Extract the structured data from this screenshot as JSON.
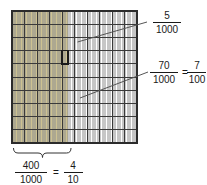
{
  "figure": {
    "type": "fraction-grid-diagram",
    "grid": {
      "major_columns": 10,
      "major_rows": 10,
      "sub_columns_per_major": 10,
      "total_parts": 1000,
      "shaded_parts": 405,
      "shaded_color": "#cdc292",
      "unshaded_color": "#ffffff",
      "line_color": "#3a3a3a",
      "thin_line_color": "#8d8d8d",
      "border_color": "#2b2b2b"
    },
    "highlight_box": {
      "label": "five-thousandths-box",
      "parts": 5,
      "stroke_color": "#1a1a1a"
    }
  },
  "labels": {
    "top_fraction": {
      "name": "five-thousandths",
      "numerator": "5",
      "denominator": "1000"
    },
    "middle_fraction": {
      "name": "seventy-thousandths",
      "numerator": "70",
      "denominator": "1000",
      "equals": "=",
      "equiv_numerator": "7",
      "equiv_denominator": "100"
    },
    "bottom_fraction": {
      "name": "four-hundred-thousandths",
      "numerator": "400",
      "denominator": "1000",
      "equals": "=",
      "equiv_numerator": "4",
      "equiv_denominator": "10"
    }
  },
  "annotations": {
    "leader_line_top": "leader-line-to-five-thousandths",
    "leader_line_middle": "leader-line-to-seventy-thousandths",
    "brace_bottom": "brace-under-shaded-columns"
  }
}
